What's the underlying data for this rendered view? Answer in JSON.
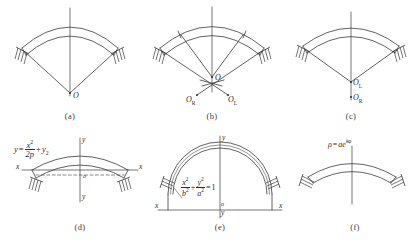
{
  "figure": {
    "background": "#ffffff",
    "line_color": "#3a3a3a",
    "panels": [
      {
        "id": "a",
        "caption": "(a)",
        "description": "circular arch axis with single center O",
        "centers": [
          {
            "label": "O",
            "sub": ""
          }
        ]
      },
      {
        "id": "b",
        "caption": "(b)",
        "description": "three-centered arch axis with centers O, O_R and O_L",
        "centers": [
          {
            "label": "O",
            "sub": ""
          },
          {
            "label": "O",
            "sub": "R"
          },
          {
            "label": "O",
            "sub": "L"
          }
        ]
      },
      {
        "id": "c",
        "caption": "(c)",
        "description": "two-centered arch axis with centers O_L and O_R on the vertical axis",
        "centers": [
          {
            "label": "O",
            "sub": "L"
          },
          {
            "label": "O",
            "sub": "R"
          }
        ]
      },
      {
        "id": "d",
        "caption": "(d)",
        "description": "parabolic arch axis referred to x-y axes",
        "equation": {
          "lhs": "y",
          "eq": "=",
          "frac_num": "x",
          "frac_num_sup": "2",
          "frac_den": "2p",
          "plus": "+",
          "tail": "y",
          "tail_sub": "2"
        },
        "axis_labels": {
          "x_left": "x",
          "x_right": "x",
          "y_top": "y",
          "y_bottom": "y",
          "origin": "o"
        }
      },
      {
        "id": "e",
        "caption": "(e)",
        "description": "elliptical arch axis referred to x-y axes",
        "equation": {
          "t1_num": "x",
          "t1_num_sup": "2",
          "t1_den": "b",
          "t1_den_sup": "2",
          "plus": "+",
          "t2_num": "y",
          "t2_num_sup": "2",
          "t2_den": "a",
          "t2_den_sup": "2",
          "eq": "=",
          "rhs": "1"
        },
        "axis_labels": {
          "x_left": "x",
          "x_right": "x",
          "y_top": "y",
          "y_bottom": "y",
          "origin": "o"
        }
      },
      {
        "id": "f",
        "caption": "(f)",
        "description": "catenary / logarithmic spiral arch axis",
        "equation": {
          "lhs": "ρ",
          "eq": "=",
          "rhs": "ae",
          "exp_k": "k",
          "exp_phi": "φ"
        }
      }
    ]
  }
}
